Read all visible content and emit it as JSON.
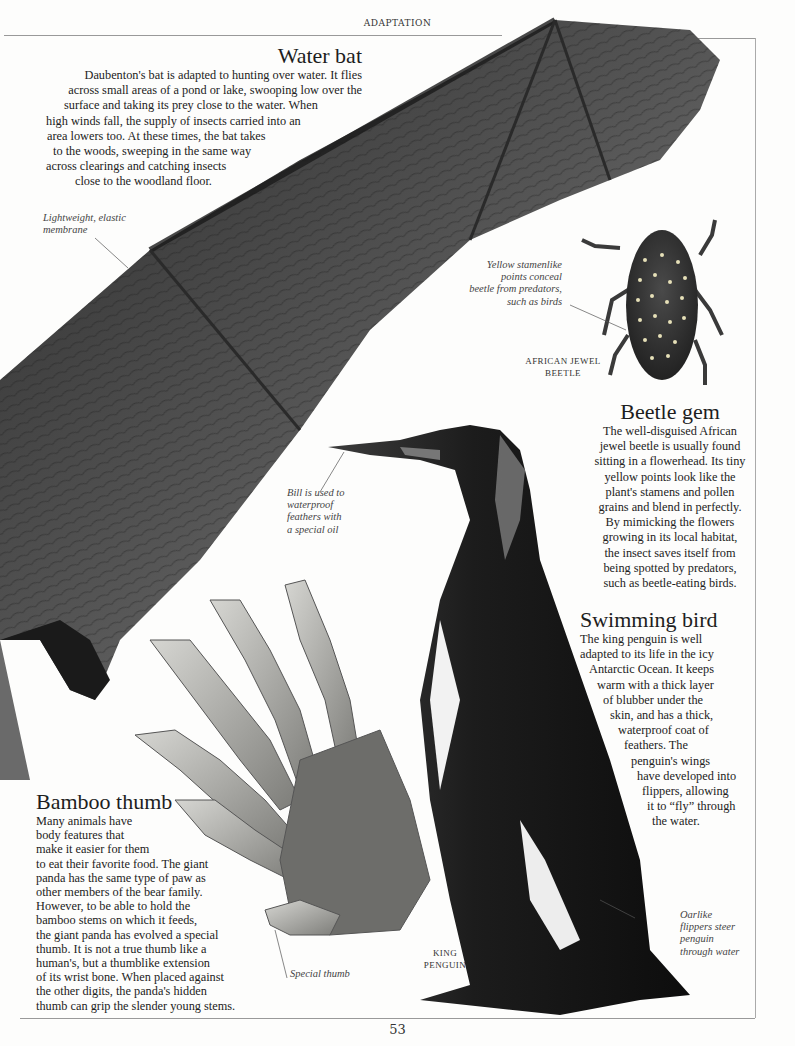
{
  "page": {
    "running_head": "ADAPTATION",
    "page_number": "53"
  },
  "sections": {
    "water_bat": {
      "title": "Water bat",
      "lines": [
        "Daubenton's bat is adapted to hunting over water. It flies",
        "across small areas of a pond or lake, swooping low over the",
        "surface and taking its prey close to the water. When",
        "high winds fall, the supply of insects carried into an",
        "area lowers too. At these times, the bat takes",
        "to the woods, sweeping in the same way",
        "across clearings and catching insects",
        "close to the woodland floor."
      ]
    },
    "beetle_gem": {
      "title": "Beetle gem",
      "lines": [
        "The well-disguised African",
        "jewel beetle is usually found",
        "sitting in a flowerhead. Its tiny",
        "yellow points look like the",
        "plant's stamens and pollen",
        "grains and blend in perfectly.",
        "By mimicking the flowers",
        "growing in its local habitat,",
        "the insect saves itself from",
        "being spotted by predators,",
        "such as beetle-eating birds."
      ]
    },
    "swimming_bird": {
      "title": "Swimming bird",
      "lines": [
        "The king penguin is well",
        "adapted to its life in the icy",
        "Antarctic Ocean. It keeps",
        "warm with a thick layer",
        "of blubber under the",
        "skin, and has a thick,",
        "waterproof coat of",
        "feathers. The",
        "penguin's wings",
        "have developed into",
        "flippers, allowing",
        "it to “fly” through",
        "the water."
      ]
    },
    "bamboo_thumb": {
      "title": "Bamboo thumb",
      "lines": [
        "Many animals have",
        "body features that",
        "make it easier for them",
        "to eat their favorite food. The giant",
        "panda has the same type of paw as",
        "other members of the bear family.",
        "However, to be able to hold the",
        "bamboo stems on which it feeds,",
        "the giant panda has evolved a special",
        "thumb. It is not a true thumb like a",
        "human's, but a thumblike extension",
        "of its wrist bone. When placed against",
        "the other digits, the panda's hidden",
        "thumb can grip the slender young stems."
      ]
    }
  },
  "captions": {
    "membrane": [
      "Lightweight, elastic",
      "membrane"
    ],
    "beetle_points": [
      "Yellow stamenlike",
      "points conceal",
      "beetle from predators,",
      "such as birds"
    ],
    "bill": [
      "Bill is used to",
      "waterproof",
      "feathers with",
      "a special oil"
    ],
    "special_thumb": [
      "Special thumb"
    ],
    "flippers": [
      "Oarlike",
      "flippers steer",
      "penguin",
      "through water"
    ]
  },
  "labels": {
    "beetle": [
      "AFRICAN JEWEL",
      "BEETLE"
    ],
    "penguin": [
      "KING",
      "PENGUIN"
    ]
  },
  "images": {
    "bat_wing": "bat-wing-photo",
    "beetle": "african-jewel-beetle-photo",
    "penguin": "king-penguin-photo",
    "panda_paw": "panda-paw-skeleton-photo"
  }
}
